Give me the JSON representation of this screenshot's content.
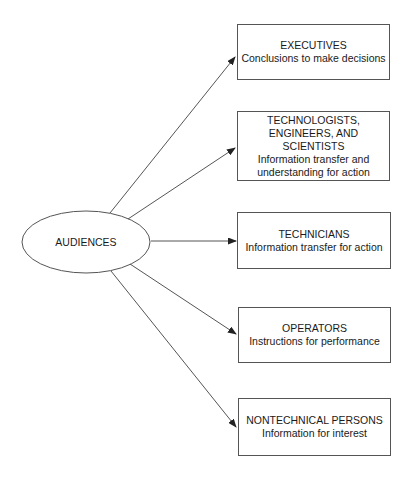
{
  "diagram": {
    "center": {
      "label": "AUDIENCES"
    },
    "audiences": [
      {
        "title": "EXECUTIVES",
        "lines": [
          "Conclusions to make decisions"
        ]
      },
      {
        "title": "TECHNOLOGISTS,\nENGINEERS, AND SCIENTISTS",
        "title_lines": [
          "TECHNOLOGISTS,",
          "ENGINEERS, AND SCIENTISTS"
        ],
        "lines": [
          "Information transfer and",
          "understanding for action"
        ]
      },
      {
        "title": "TECHNICIANS",
        "lines": [
          "Information transfer for action"
        ]
      },
      {
        "title": "OPERATORS",
        "lines": [
          "Instructions for performance"
        ]
      },
      {
        "title": "NONTECHNICAL PERSONS",
        "lines": [
          "Information for interest"
        ]
      }
    ],
    "colors": {
      "line": "#555555",
      "text": "#1a1a1a",
      "background": "#ffffff"
    }
  }
}
